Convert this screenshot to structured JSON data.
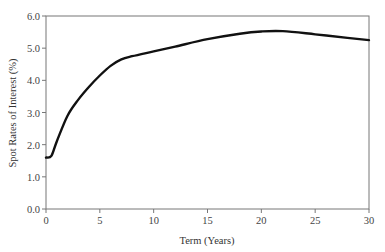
{
  "chart_data": {
    "type": "line",
    "title": "",
    "xlabel": "Term (Years)",
    "ylabel": "Spot Rates of Interest (%)",
    "xlim": [
      0,
      30
    ],
    "ylim": [
      0.0,
      6.0
    ],
    "xticks": [
      0,
      5,
      10,
      15,
      20,
      25,
      30
    ],
    "yticks": [
      "0.0",
      "1.0",
      "2.0",
      "3.0",
      "4.0",
      "5.0",
      "6.0"
    ],
    "grid": false,
    "legend": null,
    "series": [
      {
        "name": "Spot rate curve",
        "color": "#111111",
        "x": [
          0,
          0.5,
          1,
          2,
          3,
          4,
          5,
          6,
          7,
          8,
          10,
          12,
          15,
          18,
          20,
          22,
          25,
          28,
          30
        ],
        "y": [
          1.6,
          1.65,
          2.1,
          2.9,
          3.4,
          3.8,
          4.15,
          4.45,
          4.65,
          4.75,
          4.9,
          5.05,
          5.28,
          5.45,
          5.52,
          5.53,
          5.43,
          5.32,
          5.25
        ]
      }
    ]
  }
}
